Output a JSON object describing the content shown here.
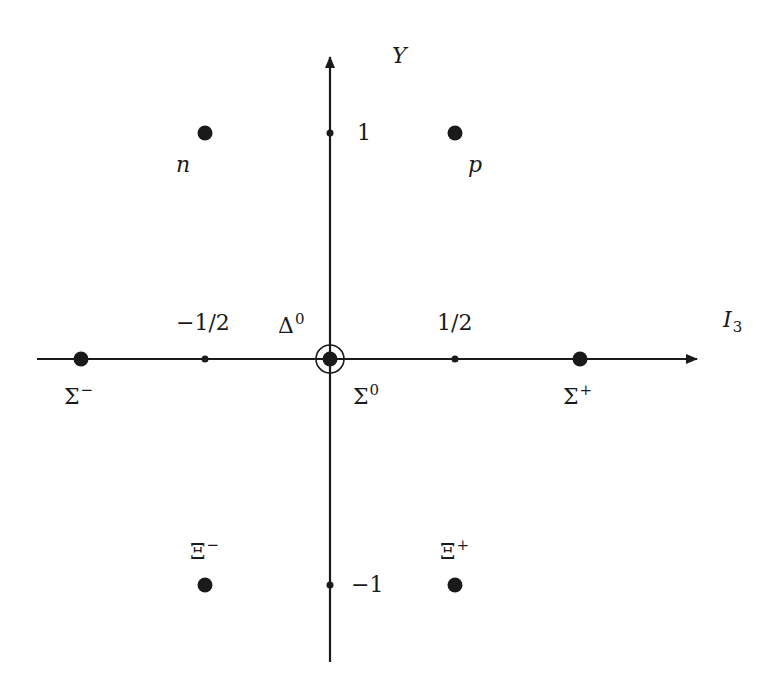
{
  "axes": {
    "x_label": "I",
    "x_label_sub": "3",
    "y_label": "Y",
    "x_ticks": [
      {
        "value": -0.5,
        "label": "−1/2"
      },
      {
        "value": 0.5,
        "label": "1/2"
      }
    ],
    "y_ticks": [
      {
        "value": 1,
        "label": "1"
      },
      {
        "value": -1,
        "label": "−1"
      }
    ]
  },
  "particles": [
    {
      "name": "n",
      "symbol": "n",
      "sup": "",
      "I3": -0.5,
      "Y": 1
    },
    {
      "name": "p",
      "symbol": "p",
      "sup": "",
      "I3": 0.5,
      "Y": 1
    },
    {
      "name": "Sigma-minus",
      "symbol": "Σ",
      "sup": "−",
      "I3": -1,
      "Y": 0
    },
    {
      "name": "Sigma-zero",
      "symbol": "Σ",
      "sup": "0",
      "I3": 0,
      "Y": 0
    },
    {
      "name": "Delta-zero",
      "symbol": "Δ",
      "sup": "0",
      "I3": 0,
      "Y": 0
    },
    {
      "name": "Sigma-plus",
      "symbol": "Σ",
      "sup": "+",
      "I3": 1,
      "Y": 0
    },
    {
      "name": "Xi-minus",
      "symbol": "Ξ",
      "sup": "−",
      "I3": -0.5,
      "Y": -1
    },
    {
      "name": "Xi-plus",
      "symbol": "Ξ",
      "sup": "+",
      "I3": 0.5,
      "Y": -1
    }
  ],
  "colors": {
    "ink": "#1a1a1a",
    "background": "#ffffff"
  }
}
